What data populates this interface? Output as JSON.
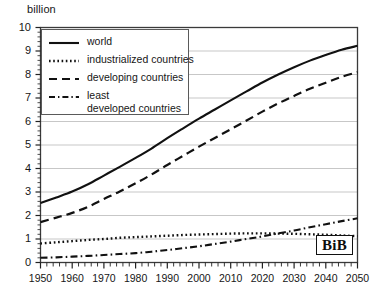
{
  "chart_data": {
    "type": "line",
    "title": "",
    "subtitle": "",
    "xlabel": "",
    "ylabel": "billion",
    "yunit_label": "billion",
    "xlim": [
      1950,
      2050
    ],
    "ylim": [
      0,
      10
    ],
    "grid": true,
    "grid_axis": "y",
    "legend_position": "upper-left-inside",
    "x_ticks": [
      1950,
      1960,
      1970,
      1980,
      1990,
      2000,
      2010,
      2020,
      2030,
      2040,
      2050
    ],
    "x_tick_labels": [
      "1950",
      "1960",
      "1970",
      "1980",
      "1990",
      "2000",
      "2010",
      "2020",
      "2030",
      "2040",
      "2050"
    ],
    "x_minor_tick_step": 2,
    "y_ticks": [
      0,
      1,
      2,
      3,
      4,
      5,
      6,
      7,
      8,
      9,
      10
    ],
    "y_tick_labels": [
      "0",
      "1",
      "2",
      "3",
      "4",
      "5",
      "6",
      "7",
      "8",
      "9",
      "10"
    ],
    "y_minor_tick_step": 0.2,
    "x": [
      1950,
      1955,
      1960,
      1965,
      1970,
      1975,
      1980,
      1985,
      1990,
      1995,
      2000,
      2005,
      2010,
      2015,
      2020,
      2025,
      2030,
      2035,
      2040,
      2045,
      2050
    ],
    "series": [
      {
        "name": "world",
        "style": "solid",
        "color": "#111111",
        "values": [
          2.53,
          2.77,
          3.02,
          3.33,
          3.7,
          4.07,
          4.45,
          4.85,
          5.29,
          5.71,
          6.12,
          6.51,
          6.9,
          7.28,
          7.66,
          8.0,
          8.31,
          8.59,
          8.83,
          9.05,
          9.22
        ]
      },
      {
        "name": "industrialized countries",
        "style": "dotted",
        "color": "#111111",
        "values": [
          0.81,
          0.86,
          0.91,
          0.96,
          1.0,
          1.05,
          1.08,
          1.11,
          1.14,
          1.17,
          1.19,
          1.21,
          1.23,
          1.24,
          1.24,
          1.23,
          1.22,
          1.2,
          1.18,
          1.15,
          1.12
        ]
      },
      {
        "name": "developing countries",
        "style": "dashed",
        "color": "#111111",
        "values": [
          1.72,
          1.91,
          2.11,
          2.37,
          2.7,
          3.02,
          3.37,
          3.74,
          4.15,
          4.54,
          4.93,
          5.3,
          5.67,
          6.04,
          6.42,
          6.77,
          7.09,
          7.39,
          7.65,
          7.9,
          8.1
        ]
      },
      {
        "name": "least developed countries",
        "style": "dash-dot",
        "color": "#111111",
        "values": [
          0.2,
          0.22,
          0.25,
          0.28,
          0.32,
          0.36,
          0.4,
          0.46,
          0.53,
          0.61,
          0.69,
          0.79,
          0.89,
          1.0,
          1.11,
          1.24,
          1.36,
          1.5,
          1.63,
          1.76,
          1.88
        ]
      }
    ],
    "legend_entries": [
      {
        "label": "world",
        "style": "solid"
      },
      {
        "label": "industrialized countries",
        "style": "dotted"
      },
      {
        "label": "developing countries",
        "style": "dashed"
      },
      {
        "label": "least",
        "label_line2": "developed countries",
        "style": "dash-dot"
      }
    ],
    "annotations": [
      {
        "name": "bib-logo",
        "text": "BiB"
      }
    ]
  },
  "logo": {
    "text": "BiB"
  }
}
